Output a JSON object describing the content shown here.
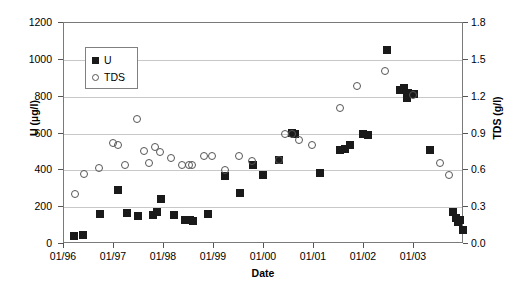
{
  "chart_data": {
    "type": "scatter",
    "title": "",
    "xlabel": "Date",
    "ylabel": "U (µg/l)",
    "y2label": "TDS (g/l)",
    "grid": true,
    "legend_position": "upper-left-inside",
    "xlim": [
      0,
      8
    ],
    "xtick_labels": [
      "01/96",
      "01/97",
      "01/98",
      "01/99",
      "01/00",
      "01/01",
      "01/02",
      "01/03"
    ],
    "xtick_values": [
      0,
      1,
      2,
      3,
      4,
      5,
      6,
      7
    ],
    "ylim": [
      0,
      1200
    ],
    "ytick_labels": [
      "0",
      "200",
      "400",
      "600",
      "800",
      "1000",
      "1200"
    ],
    "ytick_values": [
      0,
      200,
      400,
      600,
      800,
      1000,
      1200
    ],
    "y2lim": [
      0.0,
      1.8
    ],
    "y2tick_labels": [
      "0.0",
      "0.3",
      "0.6",
      "0.9",
      "1.2",
      "1.5",
      "1.8"
    ],
    "y2tick_values": [
      0.0,
      0.3,
      0.6,
      0.9,
      1.2,
      1.5,
      1.8
    ],
    "series": [
      {
        "name": "U",
        "axis": "left",
        "marker": "filled-square",
        "color": "#1a1a1a",
        "points": [
          {
            "x": 0.2,
            "y": 45
          },
          {
            "x": 0.38,
            "y": 48
          },
          {
            "x": 0.72,
            "y": 163
          },
          {
            "x": 1.08,
            "y": 295
          },
          {
            "x": 1.25,
            "y": 168
          },
          {
            "x": 1.47,
            "y": 152
          },
          {
            "x": 1.78,
            "y": 160
          },
          {
            "x": 1.86,
            "y": 172
          },
          {
            "x": 1.93,
            "y": 245
          },
          {
            "x": 2.2,
            "y": 155
          },
          {
            "x": 2.42,
            "y": 133
          },
          {
            "x": 2.52,
            "y": 128
          },
          {
            "x": 2.58,
            "y": 123
          },
          {
            "x": 2.87,
            "y": 162
          },
          {
            "x": 3.22,
            "y": 368
          },
          {
            "x": 3.52,
            "y": 275
          },
          {
            "x": 3.78,
            "y": 430
          },
          {
            "x": 3.98,
            "y": 373
          },
          {
            "x": 4.3,
            "y": 455
          },
          {
            "x": 4.55,
            "y": 602
          },
          {
            "x": 4.62,
            "y": 598
          },
          {
            "x": 5.12,
            "y": 383
          },
          {
            "x": 5.52,
            "y": 510
          },
          {
            "x": 5.62,
            "y": 518
          },
          {
            "x": 5.72,
            "y": 535
          },
          {
            "x": 5.98,
            "y": 597
          },
          {
            "x": 6.08,
            "y": 592
          },
          {
            "x": 6.45,
            "y": 1055
          },
          {
            "x": 6.72,
            "y": 838
          },
          {
            "x": 6.8,
            "y": 848
          },
          {
            "x": 6.85,
            "y": 795
          },
          {
            "x": 6.88,
            "y": 818
          },
          {
            "x": 7.0,
            "y": 815
          },
          {
            "x": 7.32,
            "y": 512
          },
          {
            "x": 7.78,
            "y": 172
          },
          {
            "x": 7.84,
            "y": 143
          },
          {
            "x": 7.88,
            "y": 118
          },
          {
            "x": 7.92,
            "y": 130
          },
          {
            "x": 7.98,
            "y": 75
          }
        ]
      },
      {
        "name": "TDS",
        "axis": "right",
        "marker": "open-circle",
        "color": "#555555",
        "points": [
          {
            "x": 0.22,
            "y": 0.41
          },
          {
            "x": 0.4,
            "y": 0.57
          },
          {
            "x": 0.7,
            "y": 0.62
          },
          {
            "x": 0.98,
            "y": 0.82
          },
          {
            "x": 1.08,
            "y": 0.81
          },
          {
            "x": 1.22,
            "y": 0.64
          },
          {
            "x": 1.45,
            "y": 1.02
          },
          {
            "x": 1.6,
            "y": 0.76
          },
          {
            "x": 1.7,
            "y": 0.66
          },
          {
            "x": 1.82,
            "y": 0.79
          },
          {
            "x": 1.92,
            "y": 0.75
          },
          {
            "x": 2.14,
            "y": 0.7
          },
          {
            "x": 2.35,
            "y": 0.64
          },
          {
            "x": 2.5,
            "y": 0.645
          },
          {
            "x": 2.56,
            "y": 0.645
          },
          {
            "x": 2.8,
            "y": 0.72
          },
          {
            "x": 2.95,
            "y": 0.72
          },
          {
            "x": 3.22,
            "y": 0.6
          },
          {
            "x": 3.5,
            "y": 0.72
          },
          {
            "x": 3.76,
            "y": 0.68
          },
          {
            "x": 4.3,
            "y": 0.685
          },
          {
            "x": 4.42,
            "y": 0.895
          },
          {
            "x": 4.55,
            "y": 0.9
          },
          {
            "x": 4.7,
            "y": 0.845
          },
          {
            "x": 4.95,
            "y": 0.81
          },
          {
            "x": 5.52,
            "y": 1.11
          },
          {
            "x": 5.85,
            "y": 1.29
          },
          {
            "x": 6.42,
            "y": 1.41
          },
          {
            "x": 6.98,
            "y": 1.21
          },
          {
            "x": 7.52,
            "y": 0.66
          },
          {
            "x": 7.7,
            "y": 0.56
          }
        ]
      }
    ]
  },
  "legend": {
    "items": [
      {
        "label": "U",
        "marker": "filled-square"
      },
      {
        "label": "TDS",
        "marker": "open-circle"
      }
    ]
  }
}
